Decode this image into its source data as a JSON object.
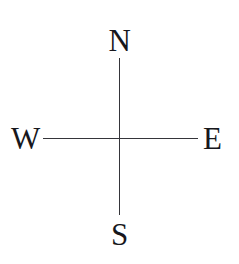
{
  "figure": {
    "name": "compass-directions-diagram",
    "background_color": "#ffffff",
    "width": 239,
    "height": 264
  },
  "axes": {
    "line_color": "#35353a",
    "vertical": {
      "name": "north-south-axis",
      "x": 119,
      "y_top": 58,
      "y_bottom": 215
    },
    "horizontal": {
      "name": "west-east-axis",
      "y": 138,
      "x_left": 43,
      "x_right": 198
    }
  },
  "labels": {
    "text_color": "#17171c",
    "north": "N",
    "south": "S",
    "west": "W",
    "east": "E"
  }
}
